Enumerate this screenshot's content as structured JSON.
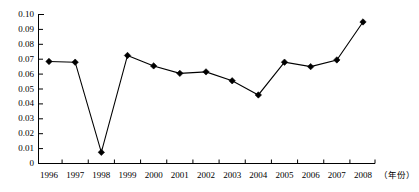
{
  "chart_data": {
    "type": "line",
    "title": "",
    "subtitle": "",
    "xlabel": "（年份）",
    "ylabel": "",
    "categories": [
      "1996",
      "1997",
      "1998",
      "1999",
      "2000",
      "2001",
      "2002",
      "2003",
      "2004",
      "2005",
      "2006",
      "2007",
      "2008"
    ],
    "values": [
      0.0685,
      0.068,
      0.0075,
      0.0725,
      0.0655,
      0.0605,
      0.0615,
      0.0555,
      0.046,
      0.068,
      0.065,
      0.0695,
      0.095
    ],
    "series": [
      {
        "name": "series-1",
        "values": [
          0.0685,
          0.068,
          0.0075,
          0.0725,
          0.0655,
          0.0605,
          0.0615,
          0.0555,
          0.046,
          0.068,
          0.065,
          0.0695,
          0.095
        ]
      }
    ],
    "ylim": [
      0,
      0.1
    ],
    "xlim": [
      "1996",
      "2008"
    ],
    "yticks": [
      0,
      0.01,
      0.02,
      0.03,
      0.04,
      0.05,
      0.06,
      0.07,
      0.08,
      0.09,
      0.1
    ],
    "ytick_labels": [
      "0",
      "0.01",
      "0.02",
      "0.03",
      "0.04",
      "0.05",
      "0.06",
      "0.07",
      "0.08",
      "0.09",
      "0.10"
    ],
    "xtick_labels": [
      "1996",
      "1997",
      "1998",
      "1999",
      "2000",
      "2001",
      "2002",
      "2003",
      "2004",
      "2005",
      "2006",
      "2007",
      "2008"
    ],
    "grid": false,
    "legend": false,
    "legend_position": "none",
    "marker": "diamond",
    "line_color": "#000000",
    "marker_color": "#000000",
    "axis_color": "#000000",
    "background_color": "#ffffff",
    "annotations": []
  },
  "axis": {
    "x_title": "（年份）"
  }
}
